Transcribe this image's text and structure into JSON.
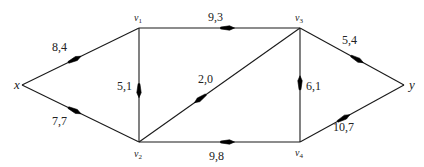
{
  "diagram": {
    "type": "flow-network",
    "nodes": [
      {
        "id": "x",
        "label": "x",
        "sub": "",
        "pos": [
          22,
          85
        ],
        "label_pos": [
          14,
          89
        ],
        "size": "big"
      },
      {
        "id": "v1",
        "label": "v",
        "sub": "1",
        "pos": [
          139,
          28
        ],
        "label_pos": [
          134,
          21
        ],
        "size": "small"
      },
      {
        "id": "v3",
        "label": "v",
        "sub": "3",
        "pos": [
          300,
          28
        ],
        "label_pos": [
          295,
          21
        ],
        "size": "small"
      },
      {
        "id": "v2",
        "label": "v",
        "sub": "2",
        "pos": [
          139,
          142
        ],
        "label_pos": [
          134,
          157
        ],
        "size": "small"
      },
      {
        "id": "v4",
        "label": "v",
        "sub": "4",
        "pos": [
          300,
          142
        ],
        "label_pos": [
          295,
          156
        ],
        "size": "small"
      },
      {
        "id": "y",
        "label": "y",
        "sub": "",
        "pos": [
          404,
          85
        ],
        "label_pos": [
          409,
          89
        ],
        "size": "big"
      }
    ],
    "edges": [
      {
        "from": "x",
        "to": "v1",
        "label": "8,4",
        "label_pos": [
          52,
          51
        ],
        "arrow_t": 0.45
      },
      {
        "from": "x",
        "to": "v2",
        "label": "7,7",
        "label_pos": [
          52,
          125
        ],
        "arrow_t": 0.45
      },
      {
        "from": "v1",
        "to": "v3",
        "label": "9,3",
        "label_pos": [
          208,
          21
        ],
        "arrow_t": 0.55
      },
      {
        "from": "v1",
        "to": "v2",
        "label": "5,1",
        "label_pos": [
          117,
          90
        ],
        "arrow_t": 0.55
      },
      {
        "from": "v3",
        "to": "v2",
        "label": "2,0",
        "label_pos": [
          198,
          83
        ],
        "arrow_t": 0.62
      },
      {
        "from": "v4",
        "to": "v3",
        "label": "6,1",
        "label_pos": [
          306,
          90
        ],
        "arrow_t": 0.52
      },
      {
        "from": "v2",
        "to": "v4",
        "label": "9,8",
        "label_pos": [
          209,
          160
        ],
        "arrow_t": 0.55
      },
      {
        "from": "v3",
        "to": "y",
        "label": "5,4",
        "label_pos": [
          342,
          44
        ],
        "arrow_t": 0.55
      },
      {
        "from": "v4",
        "to": "y",
        "label": "10,7",
        "label_pos": [
          333,
          131
        ],
        "arrow_t": 0.42
      }
    ]
  }
}
